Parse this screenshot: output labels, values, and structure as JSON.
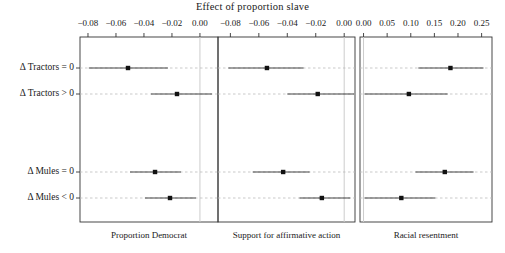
{
  "chart": {
    "title": "Effect of proportion slave",
    "type": "dot-with-error-bars",
    "panels": [
      {
        "name": "Proportion Democrat",
        "label": "Proportion Democrat",
        "xlim": [
          -0.0857,
          0.0129
        ],
        "ticks": [
          -0.08,
          -0.06,
          -0.04,
          -0.02,
          0.0
        ],
        "tick_labels": [
          "−0.08",
          "−0.06",
          "−0.04",
          "−0.02",
          "0.00"
        ],
        "zero_line": 0.0,
        "points": [
          {
            "row": "Δ Tractors = 0",
            "estimate": -0.0514,
            "low": -0.0794,
            "high": -0.0229
          },
          {
            "row": "Δ Tractors > 0",
            "estimate": -0.0164,
            "low": -0.035,
            "high": 0.0086
          },
          {
            "row": "Δ Mules = 0",
            "estimate": -0.0321,
            "low": -0.05,
            "high": -0.0136
          },
          {
            "row": "Δ Mules < 0",
            "estimate": -0.0214,
            "low": -0.0393,
            "high": -0.0029
          }
        ]
      },
      {
        "name": "Support for affirmative action",
        "label": "Support for affirmative action",
        "xlim": [
          -0.0887,
          0.0076
        ],
        "ticks": [
          -0.08,
          -0.06,
          -0.04,
          -0.02,
          0.0
        ],
        "tick_labels": [
          "−0.08",
          "−0.06",
          "−0.04",
          "−0.02",
          "0.00"
        ],
        "zero_line": 0.0,
        "points": [
          {
            "row": "Δ Tractors = 0",
            "estimate": -0.0543,
            "low": -0.0814,
            "high": -0.0286
          },
          {
            "row": "Δ Tractors > 0",
            "estimate": -0.0186,
            "low": -0.04,
            "high": 0.0071
          },
          {
            "row": "Δ Mules = 0",
            "estimate": -0.0429,
            "low": -0.0643,
            "high": -0.0243
          },
          {
            "row": "Δ Mules < 0",
            "estimate": -0.0157,
            "low": -0.0314,
            "high": 0.0043
          }
        ]
      },
      {
        "name": "Racial resentment",
        "label": "Racial resentment",
        "xlim": [
          -0.0075,
          0.272
        ],
        "ticks": [
          0.0,
          0.05,
          0.1,
          0.15,
          0.2,
          0.25
        ],
        "tick_labels": [
          "0.00",
          "0.05",
          "0.10",
          "0.15",
          "0.20",
          "0.25"
        ],
        "zero_line": 0.0,
        "points": [
          {
            "row": "Δ Tractors = 0",
            "estimate": 0.184,
            "low": 0.116,
            "high": 0.254
          },
          {
            "row": "Δ Tractors > 0",
            "estimate": 0.096,
            "low": 0.002,
            "high": 0.178
          },
          {
            "row": "Δ Mules = 0",
            "estimate": 0.172,
            "low": 0.11,
            "high": 0.233
          },
          {
            "row": "Δ Mules < 0",
            "estimate": 0.08,
            "low": 0.002,
            "high": 0.152
          }
        ]
      }
    ],
    "rows": [
      {
        "label": "Δ Tractors = 0"
      },
      {
        "label": "Δ Tractors > 0"
      },
      {
        "label": "Δ Mules = 0"
      },
      {
        "label": "Δ Mules < 0"
      }
    ],
    "colors": {
      "point": "#111111",
      "line": "#444444",
      "gridline": "#bbbbbb",
      "zero_line": "#cccccc",
      "axis": "#333333",
      "background": "#ffffff"
    }
  },
  "chart_data": {
    "type": "scatter",
    "title": "Effect of proportion slave",
    "xlabel": "",
    "ylabel": "",
    "grid": true,
    "legend": "none",
    "categories": [
      "Δ Tractors = 0",
      "Δ Tractors > 0",
      "Δ Mules = 0",
      "Δ Mules < 0"
    ],
    "panels": [
      "Proportion Democrat",
      "Support for affirmative action",
      "Racial resentment"
    ],
    "series": [
      {
        "name": "Proportion Democrat",
        "xlim": [
          -0.0857,
          0.0129
        ],
        "xticks": [
          -0.08,
          -0.06,
          -0.04,
          -0.02,
          0.0
        ],
        "values": [
          -0.0514,
          -0.0164,
          -0.0321,
          -0.0214
        ],
        "ci_low": [
          -0.0794,
          -0.035,
          -0.05,
          -0.0393
        ],
        "ci_high": [
          -0.0229,
          0.0086,
          -0.0136,
          -0.0029
        ]
      },
      {
        "name": "Support for affirmative action",
        "xlim": [
          -0.0887,
          0.0076
        ],
        "xticks": [
          -0.08,
          -0.06,
          -0.04,
          -0.02,
          0.0
        ],
        "values": [
          -0.0543,
          -0.0186,
          -0.0429,
          -0.0157
        ],
        "ci_low": [
          -0.0814,
          -0.04,
          -0.0643,
          -0.0314
        ],
        "ci_high": [
          -0.0286,
          0.0071,
          -0.0243,
          0.0043
        ]
      },
      {
        "name": "Racial resentment",
        "xlim": [
          -0.0075,
          0.272
        ],
        "xticks": [
          0.0,
          0.05,
          0.1,
          0.15,
          0.2,
          0.25
        ],
        "values": [
          0.184,
          0.096,
          0.172,
          0.08
        ],
        "ci_low": [
          0.116,
          0.002,
          0.11,
          0.002
        ],
        "ci_high": [
          0.254,
          0.178,
          0.233,
          0.152
        ]
      }
    ]
  }
}
